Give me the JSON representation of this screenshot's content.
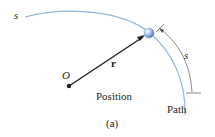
{
  "diagram": {
    "labels": {
      "path_start_s": "s",
      "origin": "O",
      "position_vector": "r",
      "arc_length_s": "s",
      "position_caption": "Position",
      "path_caption": "Path",
      "figure_label": "(a)"
    },
    "colors": {
      "path": "#8fb6dc",
      "ink": "#231f20",
      "particle": "#9ab8e6",
      "measure": "#555555"
    }
  }
}
